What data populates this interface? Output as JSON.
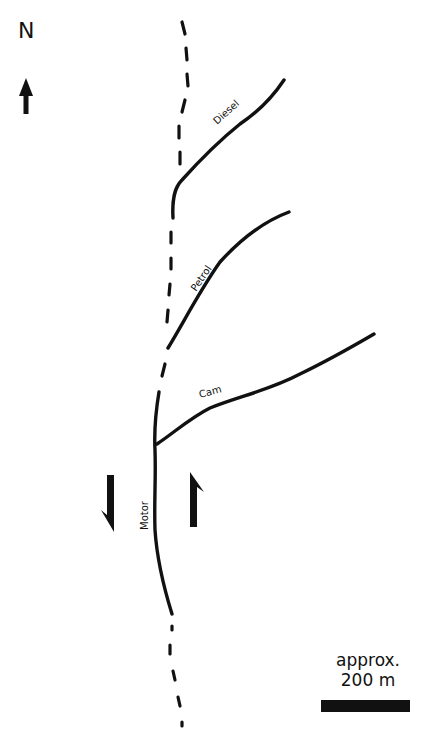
{
  "north_arrow": {
    "label": "N",
    "icon": "north-arrow-icon"
  },
  "faults": [
    {
      "name": "Diesel",
      "type": "splay"
    },
    {
      "name": "Petrol",
      "type": "splay"
    },
    {
      "name": "Cam",
      "type": "splay"
    },
    {
      "name": "Motor",
      "type": "main-fault"
    }
  ],
  "labels": {
    "diesel": "Diesel",
    "petrol": "Petrol",
    "cam": "Cam",
    "motor": "Motor"
  },
  "sense_of_motion": {
    "left_arrow": "down-arrow-half-head",
    "right_arrow": "up-arrow-half-head"
  },
  "scale": {
    "line1": "approx.",
    "line2": "200 m"
  },
  "colors": {
    "ink": "#111111",
    "background": "#ffffff"
  }
}
